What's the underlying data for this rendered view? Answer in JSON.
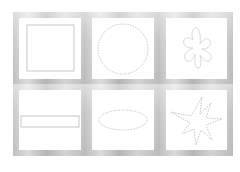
{
  "layout": {
    "rows": 2,
    "columns": 3
  },
  "colors": {
    "frame": "#c4c4c4",
    "background": "#ffffff",
    "stroke": "#b8b8b8"
  },
  "panels": [
    {
      "shape": "square",
      "row": 0,
      "col": 0
    },
    {
      "shape": "circle",
      "row": 0,
      "col": 1
    },
    {
      "shape": "flower-blob",
      "row": 0,
      "col": 2
    },
    {
      "shape": "horizontal-rectangle",
      "row": 1,
      "col": 0
    },
    {
      "shape": "ellipse",
      "row": 1,
      "col": 1
    },
    {
      "shape": "star",
      "row": 1,
      "col": 2
    }
  ]
}
